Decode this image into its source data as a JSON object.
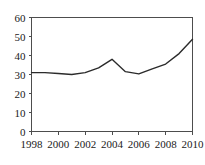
{
  "chart_data": {
    "type": "line",
    "title": "",
    "subtitle": "",
    "xlabel": "",
    "ylabel": "",
    "grid": false,
    "legend": null,
    "legend_position": "none",
    "xlim": [
      1998,
      2010
    ],
    "ylim": [
      0,
      60
    ],
    "y_ticks": [
      0,
      10,
      20,
      30,
      40,
      50,
      60
    ],
    "y_tick_labels": [
      "0",
      "10",
      "20",
      "30",
      "40",
      "50",
      "60"
    ],
    "x_ticks": [
      1998,
      2000,
      2002,
      2004,
      2006,
      2008,
      2010
    ],
    "x_tick_labels": [
      "1998",
      "2000",
      "2002",
      "2004",
      "2006",
      "2008",
      "2010"
    ],
    "x": [
      1998,
      1999,
      2000,
      2001,
      2002,
      2003,
      2004,
      2005,
      2006,
      2007,
      2008,
      2009,
      2010
    ],
    "values": [
      31,
      31,
      30.5,
      30,
      31,
      33.5,
      38,
      31.5,
      30.3,
      33,
      35.5,
      41,
      48.5
    ],
    "series": [
      {
        "name": "series-1",
        "color": "#2b2b2b",
        "values": [
          31,
          31,
          30.5,
          30,
          31,
          33.5,
          38,
          31.5,
          30.3,
          33,
          35.5,
          41,
          48.5
        ]
      }
    ],
    "colors": {
      "line": "#2b2b2b",
      "axis": "#4d4d4d",
      "text": "#1a1a1a",
      "background": "#ffffff"
    }
  }
}
